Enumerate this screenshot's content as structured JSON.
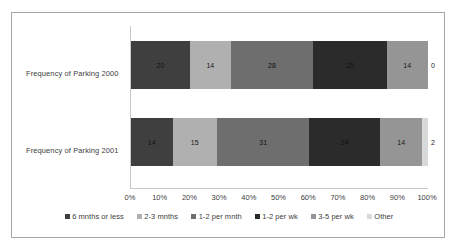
{
  "chart_data": {
    "type": "bar",
    "orientation": "horizontal",
    "stacked": true,
    "stack_mode": "percent",
    "title": "",
    "xlabel": "",
    "ylabel": "",
    "xlim": [
      0,
      100
    ],
    "x_tick_labels": [
      "0%",
      "10%",
      "20%",
      "30%",
      "40%",
      "50%",
      "60%",
      "70%",
      "80%",
      "90%",
      "100%"
    ],
    "x_tick_values": [
      0,
      10,
      20,
      30,
      40,
      50,
      60,
      70,
      80,
      90,
      100
    ],
    "grid": false,
    "legend_position": "bottom",
    "categories": [
      "Frequency of Parking 2000",
      "Frequency of Parking 2001"
    ],
    "series": [
      {
        "name": "6 mnths or less",
        "color": "#3f3f3f",
        "values": [
          20,
          14
        ]
      },
      {
        "name": "2-3 mnths",
        "color": "#b0b0b0",
        "values": [
          14,
          15
        ]
      },
      {
        "name": "1-2 per mnth",
        "color": "#6e6e6e",
        "values": [
          28,
          31
        ]
      },
      {
        "name": "1-2 per wk",
        "color": "#2b2b2b",
        "values": [
          25,
          24
        ]
      },
      {
        "name": "3-5 per wk",
        "color": "#959595",
        "values": [
          14,
          14
        ]
      },
      {
        "name": "Other",
        "color": "#d9d9d9",
        "values": [
          0,
          2
        ]
      }
    ],
    "data_labels": [
      [
        "20",
        "14",
        "28",
        "25",
        "14",
        "0"
      ],
      [
        "14",
        "15",
        "31",
        "24",
        "14",
        "2"
      ]
    ]
  }
}
